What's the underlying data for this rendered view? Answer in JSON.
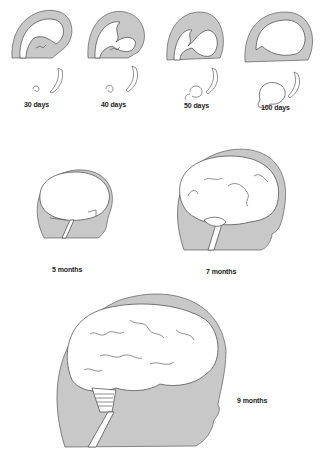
{
  "figure": {
    "colors": {
      "tissue_gray": "#c8c8c8",
      "outline": "#444444",
      "brain": "#ffffff",
      "background": "#ffffff"
    },
    "stages": [
      {
        "id": "30d",
        "label": "30 days"
      },
      {
        "id": "40d",
        "label": "40 days"
      },
      {
        "id": "50d",
        "label": "50 days"
      },
      {
        "id": "100d",
        "label": "100 days"
      },
      {
        "id": "5m",
        "label": "5 months"
      },
      {
        "id": "7m",
        "label": "7 months"
      },
      {
        "id": "9m",
        "label": "9 months"
      }
    ]
  }
}
